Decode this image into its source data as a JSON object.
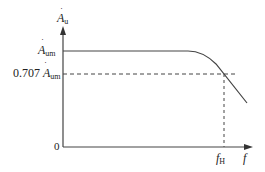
{
  "diagram": {
    "type": "frequency-response",
    "y_axis": {
      "symbol": "A",
      "subscript": "u",
      "accent": "˙"
    },
    "x_axis": {
      "symbol": "f"
    },
    "origin_label": "0",
    "labels": {
      "passband_gain": {
        "symbol": "A",
        "subscript": "um"
      },
      "cutoff_gain": {
        "coefficient": "0.707",
        "symbol": "A",
        "subscript": "um"
      },
      "cutoff_freq": {
        "symbol": "f",
        "subscript": "H"
      }
    },
    "colors": {
      "line": "#444444",
      "text": "#222222",
      "background": "#ffffff"
    }
  }
}
